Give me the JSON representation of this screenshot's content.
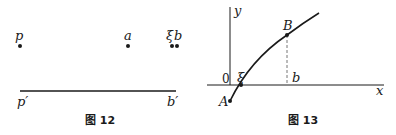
{
  "figures": [
    {
      "caption": "图 12",
      "points": [
        {
          "label": "p",
          "x": 20,
          "y": 46
        },
        {
          "label": "a",
          "x": 128,
          "y": 46
        },
        {
          "label": "ξ",
          "x": 172,
          "y": 46
        },
        {
          "label": "b",
          "x": 177,
          "y": 46
        }
      ],
      "segment": {
        "start_label": "p′",
        "end_label": "b′"
      }
    },
    {
      "caption": "图 13",
      "axes": {
        "x_label": "x",
        "y_label": "y",
        "origin_label": "0"
      },
      "points": [
        {
          "label": "A"
        },
        {
          "label": "ξ"
        },
        {
          "label": "B"
        },
        {
          "label": "b"
        }
      ]
    }
  ],
  "colors": {
    "ink": "#1a1a1a",
    "dashed": "#777777"
  }
}
